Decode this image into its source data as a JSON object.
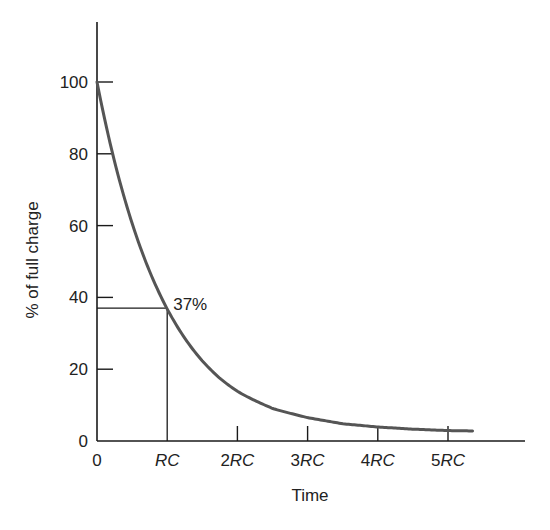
{
  "chart_data": {
    "type": "line",
    "title": "",
    "xlabel": "Time",
    "ylabel": "% of full charge",
    "x_tick_labels": [
      "0",
      "RC",
      "2RC",
      "3RC",
      "4RC",
      "5RC"
    ],
    "x_tick_prefixes": [
      "",
      "",
      "2",
      "3",
      "4",
      "5"
    ],
    "x_tick_rc": [
      "",
      "RC",
      "RC",
      "RC",
      "RC",
      "RC"
    ],
    "y_tick_labels": [
      "0",
      "20",
      "40",
      "60",
      "80",
      "100"
    ],
    "y_ticks": [
      0,
      20,
      40,
      60,
      80,
      100
    ],
    "xlim": [
      0,
      6.1
    ],
    "ylim": [
      0,
      117
    ],
    "grid": false,
    "legend": null,
    "series": [
      {
        "name": "Capacitor discharge",
        "x": [
          0,
          0.25,
          0.5,
          0.75,
          1,
          1.25,
          1.5,
          1.75,
          2,
          2.5,
          3,
          3.5,
          4,
          4.5,
          5,
          5.35
        ],
        "values": [
          100,
          78,
          61,
          47,
          37,
          29,
          23,
          18,
          14.5,
          9.5,
          6.5,
          4.8,
          3.9,
          3.3,
          2.9,
          2.8
        ],
        "color": "#555555"
      }
    ],
    "annotations": [
      {
        "text": "37%",
        "x": 1,
        "y": 37,
        "guide_lines": true
      }
    ]
  }
}
